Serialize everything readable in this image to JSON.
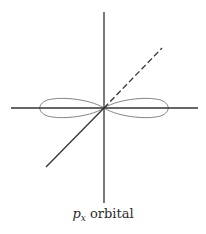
{
  "diagram": {
    "caption": {
      "symbol": "p",
      "subscript": "x",
      "text": " orbital"
    },
    "colors": {
      "axis": "#333333",
      "lobe": "#777777",
      "background": "#ffffff"
    },
    "axes": {
      "origin": [
        104,
        108
      ],
      "horizontal": {
        "from": [
          11,
          108
        ],
        "to": [
          198,
          108
        ],
        "style": "solid"
      },
      "vertical": {
        "from": [
          104,
          12
        ],
        "to": [
          104,
          203
        ],
        "style": "solid"
      },
      "diagonal_front": {
        "from": [
          104,
          108
        ],
        "to": [
          46,
          167
        ],
        "style": "solid"
      },
      "diagonal_back": {
        "from": [
          104,
          108
        ],
        "to": [
          162,
          48
        ],
        "style": "dashed"
      }
    },
    "lobes": [
      {
        "name": "left-lobe",
        "extent_x": 41
      },
      {
        "name": "right-lobe",
        "extent_x": 165
      }
    ]
  }
}
